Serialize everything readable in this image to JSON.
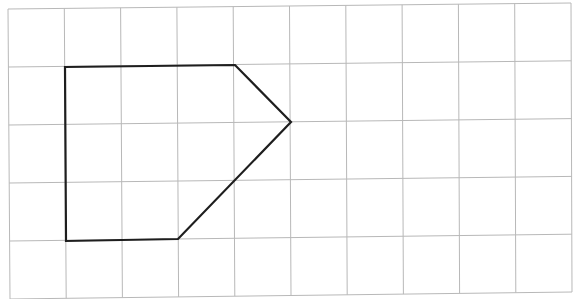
{
  "grid": {
    "columns": 10,
    "rows": 5,
    "line_color": "#b8b8b8",
    "background": "#ffffff",
    "corners": {
      "top_left": [
        8,
        9
      ],
      "top_right": [
        571,
        3
      ],
      "bottom_left": [
        10,
        299
      ],
      "bottom_right": [
        572,
        292
      ]
    }
  },
  "shape": {
    "type": "pentagon",
    "stroke": "#1e1e1e",
    "stroke_width": 2.2,
    "grid_vertices": [
      [
        1,
        1
      ],
      [
        4,
        1
      ],
      [
        5,
        2
      ],
      [
        3,
        4
      ],
      [
        1,
        4
      ]
    ],
    "pixel_vertices": [
      [
        65,
        67
      ],
      [
        235,
        65
      ],
      [
        291,
        122
      ],
      [
        178,
        239
      ],
      [
        66,
        241
      ]
    ]
  }
}
